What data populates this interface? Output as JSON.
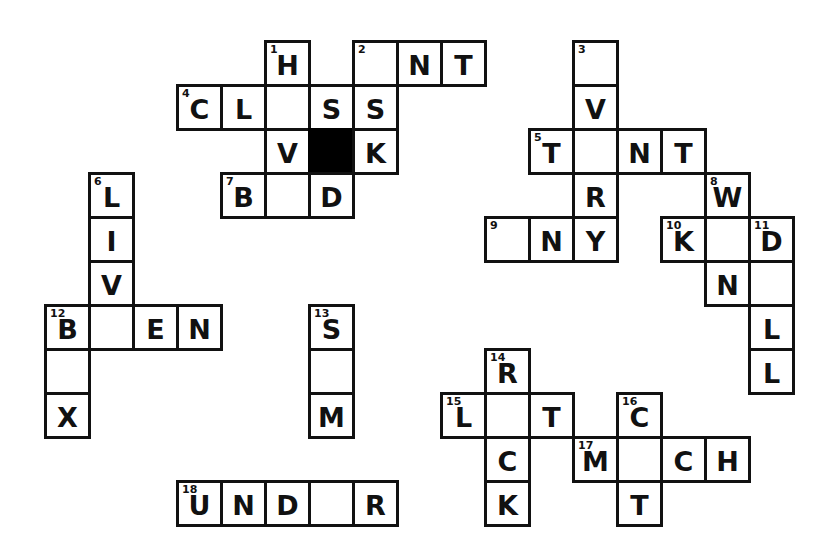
{
  "puzzle": {
    "title": "Crossword Puzzle Grid",
    "cell_size": 44,
    "origin_x": 44,
    "origin_y": 40,
    "colors": {
      "grid_line": "#111111",
      "cell_fill": "#ffffff",
      "block_fill": "#000000",
      "letter": "#111111",
      "page_background": "#ffffff"
    },
    "legend": {
      "filled_letters": 43,
      "blank_cells": 21,
      "blocked_cells": 1,
      "clue_numbers": 18
    },
    "clue_numbers": [
      1,
      2,
      3,
      4,
      5,
      6,
      7,
      8,
      9,
      10,
      11,
      12,
      13,
      14,
      15,
      16,
      17,
      18
    ],
    "cells": [
      {
        "name": "cell-r0c5",
        "col": 5,
        "row": 0,
        "letter": "H",
        "number": "1"
      },
      {
        "name": "cell-r0c7",
        "col": 7,
        "row": 0,
        "letter": "",
        "number": "2"
      },
      {
        "name": "cell-r0c8",
        "col": 8,
        "row": 0,
        "letter": "N",
        "number": ""
      },
      {
        "name": "cell-r0c9",
        "col": 9,
        "row": 0,
        "letter": "T",
        "number": ""
      },
      {
        "name": "cell-r0c12",
        "col": 12,
        "row": 0,
        "letter": "",
        "number": "3"
      },
      {
        "name": "cell-r1c3",
        "col": 3,
        "row": 1,
        "letter": "C",
        "number": "4"
      },
      {
        "name": "cell-r1c4",
        "col": 4,
        "row": 1,
        "letter": "L",
        "number": ""
      },
      {
        "name": "cell-r1c5",
        "col": 5,
        "row": 1,
        "letter": "",
        "number": ""
      },
      {
        "name": "cell-r1c6",
        "col": 6,
        "row": 1,
        "letter": "S",
        "number": ""
      },
      {
        "name": "cell-r1c7",
        "col": 7,
        "row": 1,
        "letter": "S",
        "number": ""
      },
      {
        "name": "cell-r1c12",
        "col": 12,
        "row": 1,
        "letter": "V",
        "number": ""
      },
      {
        "name": "cell-r2c5",
        "col": 5,
        "row": 2,
        "letter": "V",
        "number": ""
      },
      {
        "name": "cell-r2c6",
        "col": 6,
        "row": 2,
        "letter": "",
        "number": "",
        "block": true
      },
      {
        "name": "cell-r2c7",
        "col": 7,
        "row": 2,
        "letter": "K",
        "number": ""
      },
      {
        "name": "cell-r2c11",
        "col": 11,
        "row": 2,
        "letter": "T",
        "number": "5"
      },
      {
        "name": "cell-r2c12",
        "col": 12,
        "row": 2,
        "letter": "",
        "number": ""
      },
      {
        "name": "cell-r2c13",
        "col": 13,
        "row": 2,
        "letter": "N",
        "number": ""
      },
      {
        "name": "cell-r2c14",
        "col": 14,
        "row": 2,
        "letter": "T",
        "number": ""
      },
      {
        "name": "cell-r3c1",
        "col": 1,
        "row": 3,
        "letter": "L",
        "number": "6"
      },
      {
        "name": "cell-r3c4",
        "col": 4,
        "row": 3,
        "letter": "B",
        "number": "7"
      },
      {
        "name": "cell-r3c5",
        "col": 5,
        "row": 3,
        "letter": "",
        "number": ""
      },
      {
        "name": "cell-r3c6",
        "col": 6,
        "row": 3,
        "letter": "D",
        "number": ""
      },
      {
        "name": "cell-r3c12",
        "col": 12,
        "row": 3,
        "letter": "R",
        "number": ""
      },
      {
        "name": "cell-r3c15",
        "col": 15,
        "row": 3,
        "letter": "W",
        "number": "8"
      },
      {
        "name": "cell-r4c1",
        "col": 1,
        "row": 4,
        "letter": "I",
        "number": ""
      },
      {
        "name": "cell-r4c10",
        "col": 10,
        "row": 4,
        "letter": "",
        "number": "9"
      },
      {
        "name": "cell-r4c11",
        "col": 11,
        "row": 4,
        "letter": "N",
        "number": ""
      },
      {
        "name": "cell-r4c12",
        "col": 12,
        "row": 4,
        "letter": "Y",
        "number": ""
      },
      {
        "name": "cell-r4c14",
        "col": 14,
        "row": 4,
        "letter": "K",
        "number": "10"
      },
      {
        "name": "cell-r4c15",
        "col": 15,
        "row": 4,
        "letter": "",
        "number": ""
      },
      {
        "name": "cell-r4c16",
        "col": 16,
        "row": 4,
        "letter": "D",
        "number": "11"
      },
      {
        "name": "cell-r5c1",
        "col": 1,
        "row": 5,
        "letter": "V",
        "number": ""
      },
      {
        "name": "cell-r5c15",
        "col": 15,
        "row": 5,
        "letter": "N",
        "number": ""
      },
      {
        "name": "cell-r5c16",
        "col": 16,
        "row": 5,
        "letter": "",
        "number": ""
      },
      {
        "name": "cell-r6c0",
        "col": 0,
        "row": 6,
        "letter": "B",
        "number": "12"
      },
      {
        "name": "cell-r6c1",
        "col": 1,
        "row": 6,
        "letter": "",
        "number": ""
      },
      {
        "name": "cell-r6c2",
        "col": 2,
        "row": 6,
        "letter": "E",
        "number": ""
      },
      {
        "name": "cell-r6c3",
        "col": 3,
        "row": 6,
        "letter": "N",
        "number": ""
      },
      {
        "name": "cell-r6c6",
        "col": 6,
        "row": 6,
        "letter": "S",
        "number": "13"
      },
      {
        "name": "cell-r6c16",
        "col": 16,
        "row": 6,
        "letter": "L",
        "number": ""
      },
      {
        "name": "cell-r7c0",
        "col": 0,
        "row": 7,
        "letter": "",
        "number": ""
      },
      {
        "name": "cell-r7c6",
        "col": 6,
        "row": 7,
        "letter": "",
        "number": ""
      },
      {
        "name": "cell-r7c10",
        "col": 10,
        "row": 7,
        "letter": "R",
        "number": "14"
      },
      {
        "name": "cell-r7c16",
        "col": 16,
        "row": 7,
        "letter": "L",
        "number": ""
      },
      {
        "name": "cell-r8c0",
        "col": 0,
        "row": 8,
        "letter": "X",
        "number": ""
      },
      {
        "name": "cell-r8c6",
        "col": 6,
        "row": 8,
        "letter": "M",
        "number": ""
      },
      {
        "name": "cell-r8c9",
        "col": 9,
        "row": 8,
        "letter": "L",
        "number": "15"
      },
      {
        "name": "cell-r8c10",
        "col": 10,
        "row": 8,
        "letter": "",
        "number": ""
      },
      {
        "name": "cell-r8c11",
        "col": 11,
        "row": 8,
        "letter": "T",
        "number": ""
      },
      {
        "name": "cell-r8c13",
        "col": 13,
        "row": 8,
        "letter": "C",
        "number": "16"
      },
      {
        "name": "cell-r9c10",
        "col": 10,
        "row": 9,
        "letter": "C",
        "number": ""
      },
      {
        "name": "cell-r9c12",
        "col": 12,
        "row": 9,
        "letter": "M",
        "number": "17"
      },
      {
        "name": "cell-r9c13",
        "col": 13,
        "row": 9,
        "letter": "",
        "number": ""
      },
      {
        "name": "cell-r9c14",
        "col": 14,
        "row": 9,
        "letter": "C",
        "number": ""
      },
      {
        "name": "cell-r9c15",
        "col": 15,
        "row": 9,
        "letter": "H",
        "number": ""
      },
      {
        "name": "cell-r10c3",
        "col": 3,
        "row": 10,
        "letter": "U",
        "number": "18"
      },
      {
        "name": "cell-r10c4",
        "col": 4,
        "row": 10,
        "letter": "N",
        "number": ""
      },
      {
        "name": "cell-r10c5",
        "col": 5,
        "row": 10,
        "letter": "D",
        "number": ""
      },
      {
        "name": "cell-r10c6",
        "col": 6,
        "row": 10,
        "letter": "",
        "number": ""
      },
      {
        "name": "cell-r10c7",
        "col": 7,
        "row": 10,
        "letter": "R",
        "number": ""
      },
      {
        "name": "cell-r10c10",
        "col": 10,
        "row": 10,
        "letter": "K",
        "number": ""
      },
      {
        "name": "cell-r10c13",
        "col": 13,
        "row": 10,
        "letter": "T",
        "number": ""
      }
    ]
  }
}
